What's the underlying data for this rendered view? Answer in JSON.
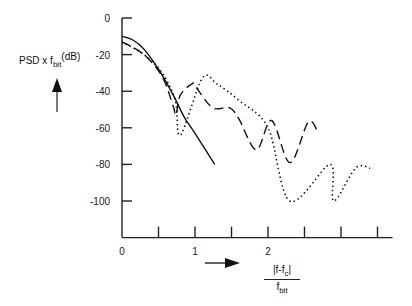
{
  "chart_data": {
    "type": "line",
    "title": "",
    "ylabel": "PSD x f_bit (dB)",
    "xlabel": "|f - f_c| / f_bit",
    "xlim": [
      0,
      3.5
    ],
    "ylim": [
      -120,
      0
    ],
    "x_ticks": [
      0,
      0.5,
      1,
      1.5,
      2,
      2.5,
      3,
      3.5
    ],
    "x_tick_labels": [
      "0",
      "",
      "1",
      "",
      "2",
      "",
      "",
      ""
    ],
    "y_ticks": [
      0,
      -20,
      -40,
      -60,
      -80,
      -100
    ],
    "y_tick_labels": [
      "0",
      "-20",
      "-40",
      "-60",
      "-80",
      "-100"
    ],
    "grid": false,
    "legend": null,
    "series": [
      {
        "name": "solid",
        "style": "solid",
        "x": [
          0,
          0.15,
          0.3,
          0.5,
          0.7,
          0.85,
          1.0,
          1.27
        ],
        "y": [
          -10,
          -12,
          -17,
          -28,
          -42,
          -54,
          -63,
          -80
        ]
      },
      {
        "name": "dashed",
        "style": "dashed",
        "x": [
          0,
          0.3,
          0.55,
          0.7,
          0.74,
          0.8,
          0.96,
          1.0,
          1.24,
          1.47,
          1.6,
          1.84,
          2.05,
          2.3,
          2.55,
          2.68
        ],
        "y": [
          -13,
          -20,
          -32,
          -48,
          -53,
          -42,
          -36,
          -37,
          -49,
          -49,
          -55,
          -72,
          -56,
          -79,
          -57,
          -62
        ]
      },
      {
        "name": "dotted",
        "style": "dotted",
        "x": [
          0,
          0.3,
          0.55,
          0.73,
          0.8,
          1.1,
          1.3,
          1.6,
          2.0,
          2.3,
          2.85,
          2.9,
          3.2,
          3.4
        ],
        "y": [
          -13,
          -20,
          -30,
          -45,
          -64,
          -33,
          -36,
          -45,
          -60,
          -100,
          -80,
          -100,
          -82,
          -82
        ]
      }
    ]
  },
  "labels": {
    "ylabel_main": "PSD x f",
    "ylabel_sub": "bit",
    "ylabel_unit": "(dB)",
    "xlabel_num_a": "|f-f",
    "xlabel_num_sub": "c",
    "xlabel_num_b": "|",
    "xlabel_den_a": "f",
    "xlabel_den_sub": "bit"
  }
}
